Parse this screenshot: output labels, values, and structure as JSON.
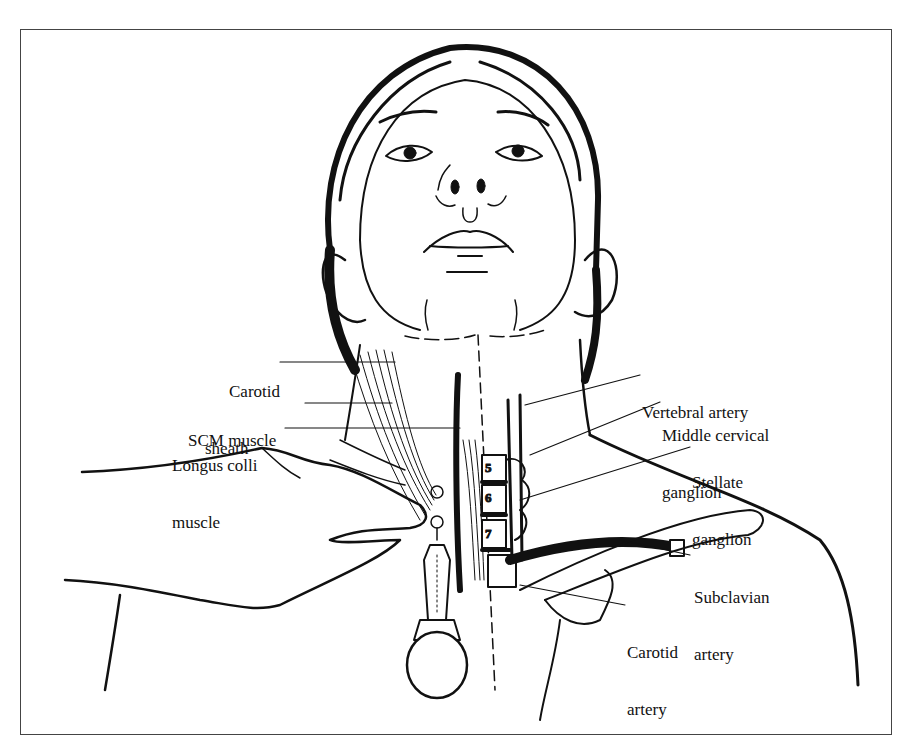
{
  "figure": {
    "colors": {
      "ink": "#111111",
      "background": "#ffffff",
      "frame": "#444444"
    },
    "labels_left": [
      {
        "id": "carotid-sheath",
        "line1": "Carotid",
        "line2": "sheath"
      },
      {
        "id": "scm-muscle",
        "line1": "SCM muscle",
        "line2": ""
      },
      {
        "id": "longus-colli-muscle",
        "line1": "Longus colli",
        "line2": "muscle"
      }
    ],
    "labels_right": [
      {
        "id": "vertebral-artery",
        "line1": "Vertebral artery",
        "line2": ""
      },
      {
        "id": "middle-cervical-ganglion",
        "line1": "Middle cervical",
        "line2": "ganglion"
      },
      {
        "id": "stellate-ganglion",
        "line1": "Stellate",
        "line2": "ganglion"
      },
      {
        "id": "subclavian-artery",
        "line1": "Subclavian",
        "line2": "artery"
      },
      {
        "id": "carotid-artery",
        "line1": "Carotid",
        "line2": "artery"
      }
    ],
    "vertebrae": [
      "5",
      "6",
      "7"
    ]
  }
}
